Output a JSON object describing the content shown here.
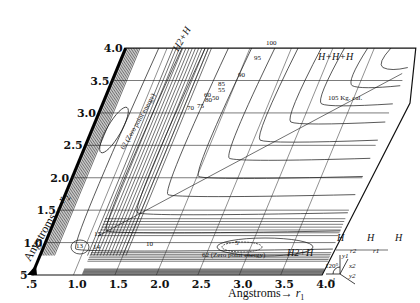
{
  "figure": {
    "x_axis": {
      "label": "Angstroms",
      "symbol": "r",
      "subscript": "1",
      "ticks": [
        ".5",
        "1.0",
        "1.5",
        "2.0",
        "2.5",
        "3.0",
        "3.5",
        "4.0"
      ],
      "range": [
        0.5,
        4.0
      ]
    },
    "y_axis": {
      "label": "Angstroms",
      "symbol": "r",
      "subscript": "2",
      "ticks": [
        "5",
        "1.0",
        "1.5",
        "2.0",
        "2.5",
        "3.0",
        "3.5",
        "4.0"
      ],
      "range": [
        0.5,
        4.0
      ]
    },
    "skew_angle_deg": 60,
    "region_labels": {
      "h2_h_top": "H2+H",
      "h2_h_bottom": "H2+H",
      "h_h_h": "H+H+H",
      "zero_point_top": "62 (Zero point energy)",
      "zero_point_bottom": "62 (Zero point energy)",
      "kgcal": "105 Kg. cal."
    },
    "contour_labels": [
      "5",
      "10",
      "13",
      "14",
      "15",
      "50",
      "55",
      "60",
      "70",
      "75",
      "80",
      "85",
      "90",
      "95",
      "100",
      "105"
    ],
    "inset": {
      "atoms": [
        "H",
        "H",
        "H"
      ],
      "distances": [
        "r2",
        "r1"
      ],
      "angle": "120°",
      "axes": [
        "x1",
        "y1",
        "x2",
        "y2",
        "y3",
        "x3"
      ]
    }
  }
}
